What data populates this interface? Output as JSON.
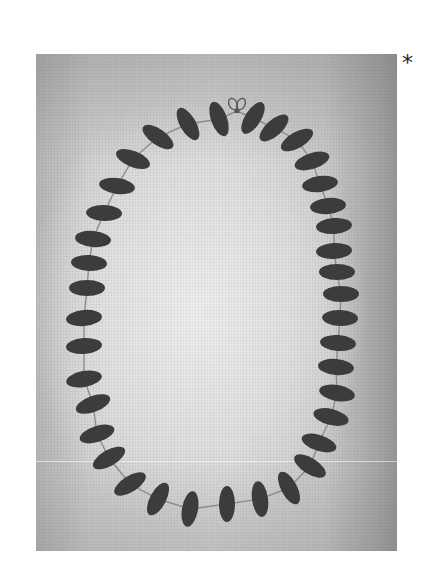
{
  "figure": {
    "marker": "*",
    "colors": {
      "bead": "#3c3c3c",
      "string": "#8c8c8c",
      "clasp": "#555555"
    },
    "clasp": {
      "x": 237,
      "y": 106
    },
    "beads": [
      {
        "x": 219,
        "y": 119,
        "rot": 70
      },
      {
        "x": 188,
        "y": 124,
        "rot": 60
      },
      {
        "x": 158,
        "y": 137,
        "rot": 35
      },
      {
        "x": 133,
        "y": 159,
        "rot": 22
      },
      {
        "x": 117,
        "y": 186,
        "rot": 8
      },
      {
        "x": 104,
        "y": 213,
        "rot": 2
      },
      {
        "x": 93,
        "y": 239,
        "rot": 5
      },
      {
        "x": 89,
        "y": 263,
        "rot": 3
      },
      {
        "x": 87,
        "y": 288,
        "rot": 0
      },
      {
        "x": 84,
        "y": 318,
        "rot": -5
      },
      {
        "x": 84,
        "y": 346,
        "rot": -4
      },
      {
        "x": 84,
        "y": 379,
        "rot": -10
      },
      {
        "x": 93,
        "y": 404,
        "rot": -20
      },
      {
        "x": 97,
        "y": 434,
        "rot": -18
      },
      {
        "x": 109,
        "y": 458,
        "rot": -30
      },
      {
        "x": 130,
        "y": 484,
        "rot": -32
      },
      {
        "x": 158,
        "y": 499,
        "rot": -62
      },
      {
        "x": 190,
        "y": 509,
        "rot": -80
      },
      {
        "x": 227,
        "y": 504,
        "rot": 90
      },
      {
        "x": 260,
        "y": 499,
        "rot": 82
      },
      {
        "x": 289,
        "y": 488,
        "rot": 62
      },
      {
        "x": 310,
        "y": 466,
        "rot": 32
      },
      {
        "x": 319,
        "y": 443,
        "rot": 18
      },
      {
        "x": 331,
        "y": 417,
        "rot": 14
      },
      {
        "x": 337,
        "y": 393,
        "rot": 10
      },
      {
        "x": 336,
        "y": 367,
        "rot": 5
      },
      {
        "x": 338,
        "y": 343,
        "rot": 4
      },
      {
        "x": 340,
        "y": 318,
        "rot": 2
      },
      {
        "x": 341,
        "y": 294,
        "rot": 0
      },
      {
        "x": 337,
        "y": 272,
        "rot": 0
      },
      {
        "x": 334,
        "y": 251,
        "rot": -3
      },
      {
        "x": 334,
        "y": 226,
        "rot": -4
      },
      {
        "x": 328,
        "y": 206,
        "rot": -5
      },
      {
        "x": 320,
        "y": 184,
        "rot": -8
      },
      {
        "x": 312,
        "y": 161,
        "rot": -18
      },
      {
        "x": 297,
        "y": 140,
        "rot": -30
      },
      {
        "x": 274,
        "y": 128,
        "rot": -42
      },
      {
        "x": 253,
        "y": 118,
        "rot": -58
      }
    ]
  }
}
